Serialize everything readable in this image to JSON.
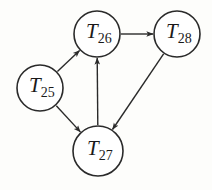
{
  "diagram": {
    "type": "directed-graph",
    "colors": {
      "stroke": "#2a2a2a",
      "node_fill": "#ffffff",
      "background": "#fdfdfb",
      "text": "#1a1a1a"
    },
    "nodes": [
      {
        "id": "T25",
        "symbol": "T",
        "subscript": "25",
        "cx": 40,
        "cy": 88,
        "r": 23
      },
      {
        "id": "T26",
        "symbol": "T",
        "subscript": "26",
        "cx": 97,
        "cy": 34,
        "r": 23
      },
      {
        "id": "T27",
        "symbol": "T",
        "subscript": "27",
        "cx": 98,
        "cy": 151,
        "r": 25
      },
      {
        "id": "T28",
        "symbol": "T",
        "subscript": "28",
        "cx": 177,
        "cy": 34,
        "r": 23
      }
    ],
    "edges": [
      {
        "from": "T25",
        "to": "T26"
      },
      {
        "from": "T25",
        "to": "T27"
      },
      {
        "from": "T27",
        "to": "T26"
      },
      {
        "from": "T26",
        "to": "T28"
      },
      {
        "from": "T28",
        "to": "T27"
      }
    ]
  }
}
